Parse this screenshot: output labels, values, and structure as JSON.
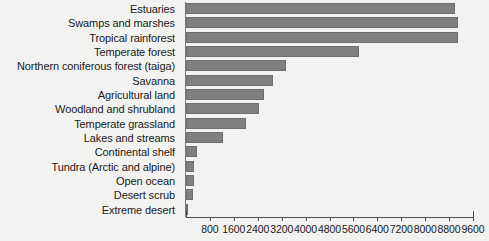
{
  "chart_data": {
    "type": "bar",
    "orientation": "horizontal",
    "title": "",
    "subtitle": "",
    "xlabel": "",
    "ylabel": "",
    "xlim": [
      0,
      9600
    ],
    "ylim": null,
    "grid": false,
    "legend": null,
    "bar_color": "#808080",
    "background_color": "#f2f2f0",
    "tick_labels": [
      "800",
      "1600",
      "2400",
      "3200",
      "4000",
      "4800",
      "5600",
      "6400",
      "7200",
      "8000",
      "8800",
      "9600"
    ],
    "tick_values": [
      800,
      1600,
      2400,
      3200,
      4000,
      4800,
      5600,
      6400,
      7200,
      8000,
      8800,
      9600
    ],
    "tick_step": 800,
    "categories": [
      "Estuaries",
      "Swamps and marshes",
      "Tropical rainforest",
      "Temperate forest",
      "Northern coniferous forest (taiga)",
      "Savanna",
      "Agricultural land",
      "Woodland and shrubland",
      "Temperate grassland",
      "Lakes and streams",
      "Continental shelf",
      "Tundra (Arctic and alpine)",
      "Open ocean",
      "Desert scrub",
      "Extreme desert"
    ],
    "values": [
      9000,
      9100,
      9100,
      5800,
      3350,
      2900,
      2600,
      2450,
      2000,
      1250,
      360,
      260,
      270,
      230,
      70
    ]
  }
}
